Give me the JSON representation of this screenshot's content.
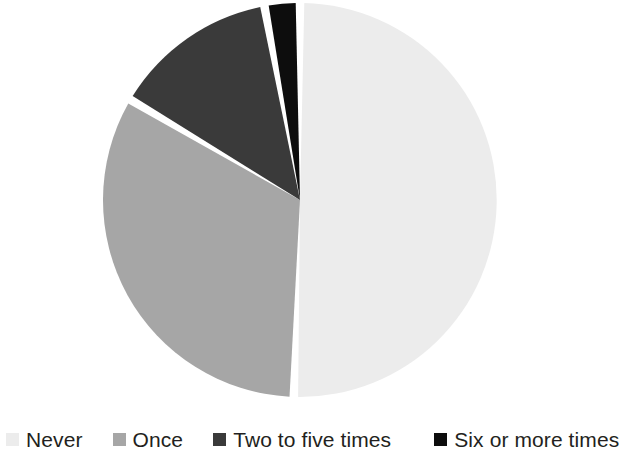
{
  "chart_data": {
    "type": "pie",
    "title": "",
    "subtitle": "",
    "xlabel": "",
    "ylabel": "",
    "legend_position": "bottom",
    "grid": false,
    "start_angle_deg": 0,
    "direction": "clockwise",
    "categories": [
      "Never",
      "Once",
      "Two to five times",
      "Six or more times"
    ],
    "values": [
      50.5,
      33.0,
      13.6,
      2.9
    ],
    "units": "percent",
    "colors": [
      "#ececec",
      "#a6a6a6",
      "#3a3a3a",
      "#0d0d0d"
    ],
    "slices": [
      {
        "label": "Never",
        "value": 50.5,
        "color": "#ececec",
        "start_angle_deg": 0,
        "end_angle_deg": 181.8
      },
      {
        "label": "Once",
        "value": 33.0,
        "color": "#a6a6a6",
        "start_angle_deg": 181.8,
        "end_angle_deg": 300.6
      },
      {
        "label": "Two to five times",
        "value": 13.6,
        "color": "#3a3a3a",
        "start_angle_deg": 300.6,
        "end_angle_deg": 349.6
      },
      {
        "label": "Six or more times",
        "value": 2.9,
        "color": "#0d0d0d",
        "start_angle_deg": 349.6,
        "end_angle_deg": 360.0
      }
    ]
  },
  "legend": {
    "items": [
      {
        "label": "Never",
        "color": "#ececec",
        "swatch": "legend-swatch-never"
      },
      {
        "label": "Once",
        "color": "#a6a6a6",
        "swatch": "legend-swatch-once"
      },
      {
        "label": "Two to five times",
        "color": "#3a3a3a",
        "swatch": "legend-swatch-two-to-five-times"
      },
      {
        "label": "Six or more times",
        "color": "#0d0d0d",
        "swatch": "legend-swatch-six-or-more-times"
      }
    ]
  },
  "style": {
    "background": "#ffffff",
    "separator_color": "#ffffff",
    "text_color": "#231f20"
  },
  "geometry": {
    "center_x": 300,
    "center_y": 200,
    "radius": 197
  }
}
